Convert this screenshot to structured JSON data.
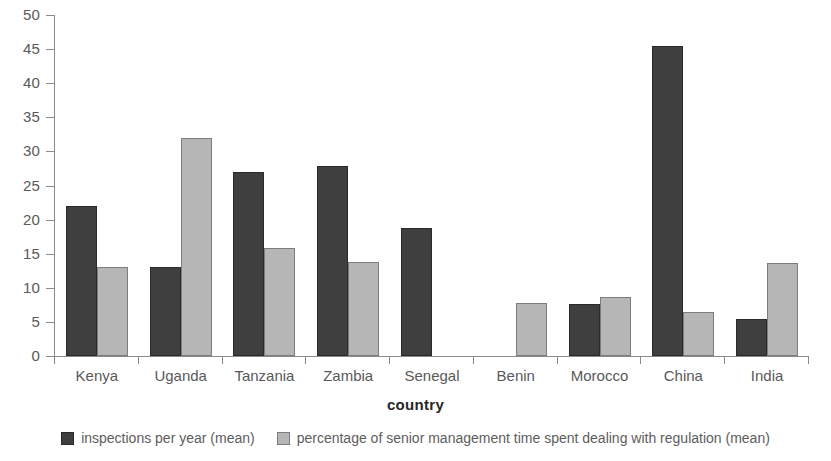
{
  "chart_data": {
    "type": "bar",
    "title": "",
    "subtitle": "",
    "xlabel": "country",
    "ylabel": "",
    "ylim": [
      0,
      50
    ],
    "y_ticks": [
      0,
      5,
      10,
      15,
      20,
      25,
      30,
      35,
      40,
      45,
      50
    ],
    "grid": false,
    "legend_position": "bottom",
    "categories": [
      "Kenya",
      "Uganda",
      "Tanzania",
      "Zambia",
      "Senegal",
      "Benin",
      "Morocco",
      "China",
      "India"
    ],
    "series": [
      {
        "name": "inspections per year (mean)",
        "color": "#3f3f3f",
        "border_color": "#2a2a2a",
        "values": [
          22.0,
          13.0,
          27.0,
          27.9,
          18.7,
          null,
          7.7,
          45.5,
          5.4
        ]
      },
      {
        "name": "percentage of senior management time spent dealing with regulation (mean)",
        "color": "#b6b6b6",
        "border_color": "#7d7d7d",
        "values": [
          13.0,
          31.9,
          15.8,
          13.8,
          null,
          7.8,
          8.6,
          6.5,
          13.6
        ]
      }
    ]
  },
  "axes": {
    "y_tick_labels": [
      "50",
      "45",
      "40",
      "35",
      "30",
      "25",
      "20",
      "15",
      "10",
      "5",
      "0"
    ],
    "x_tick_labels": [
      "Kenya",
      "Uganda",
      "Tanzania",
      "Zambia",
      "Senegal",
      "Benin",
      "Morocco",
      "China",
      "India"
    ],
    "x_axis_title": "country"
  },
  "legend": {
    "items": [
      {
        "label": "inspections per year (mean)",
        "swatch": "dark-square-swatch"
      },
      {
        "label": "percentage of senior management time spent dealing with regulation (mean)",
        "swatch": "light-square-swatch"
      }
    ]
  }
}
